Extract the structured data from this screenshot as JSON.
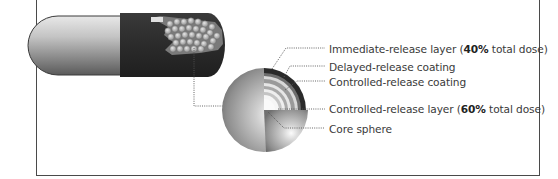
{
  "diagram": {
    "type": "capsule-bead-cutaway",
    "labels": [
      {
        "id": "immediate-release-layer",
        "prefix": "Immediate-release layer (",
        "bold": "40%",
        "suffix": " total dose)"
      },
      {
        "id": "delayed-release-coating",
        "prefix": "Delayed-release coating",
        "bold": "",
        "suffix": ""
      },
      {
        "id": "controlled-release-coating",
        "prefix": "Controlled-release coating",
        "bold": "",
        "suffix": ""
      },
      {
        "id": "controlled-release-layer",
        "prefix": "Controlled-release layer (",
        "bold": "60%",
        "suffix": " total dose)"
      },
      {
        "id": "core-sphere",
        "prefix": "Core sphere",
        "bold": "",
        "suffix": ""
      }
    ],
    "colors": {
      "frame": "#4a4a4a",
      "capsule_dark": "#2e2e2e",
      "capsule_light": "#bdbdbd",
      "text": "#3a3a3a",
      "leader": "#555555"
    }
  }
}
